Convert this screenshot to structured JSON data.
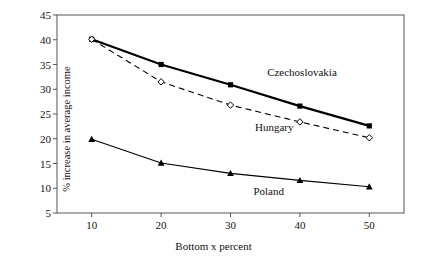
{
  "chart_data": {
    "type": "line",
    "title": "",
    "subtitle": "",
    "xlabel": "Bottom x percent",
    "ylabel": "% increase in average income",
    "x": [
      10,
      20,
      30,
      40,
      50
    ],
    "xtick_labels": [
      "10",
      "20",
      "30",
      "40",
      "50"
    ],
    "ytick_labels": [
      "5",
      "10",
      "15",
      "20",
      "25",
      "30",
      "35",
      "40",
      "45"
    ],
    "yticks": [
      5,
      10,
      15,
      20,
      25,
      30,
      35,
      40,
      45
    ],
    "xlim": [
      5,
      55
    ],
    "ylim": [
      5,
      45
    ],
    "grid": false,
    "legend_position": "inline-annotations",
    "series": [
      {
        "name": "Czechoslovakia",
        "values": [
          40.1,
          35.0,
          30.9,
          26.6,
          22.6
        ],
        "marker": "filled-square",
        "line_style": "solid",
        "line_width": 2.2,
        "color": "#000000",
        "label_x": 40.3,
        "label_y": 33.4
      },
      {
        "name": "Hungary",
        "values": [
          40.1,
          31.5,
          26.8,
          23.4,
          20.2
        ],
        "marker": "open-diamond",
        "line_style": "dashed",
        "line_width": 1.1,
        "color": "#000000",
        "label_x": 36.3,
        "label_y": 22.3
      },
      {
        "name": "Poland",
        "values": [
          19.9,
          15.1,
          13.0,
          11.6,
          10.3
        ],
        "marker": "filled-triangle",
        "line_style": "solid",
        "line_width": 1.1,
        "color": "#000000",
        "label_x": 35.5,
        "label_y": 9.4
      }
    ],
    "annotations": [
      "Czechoslovakia",
      "Hungary",
      "Poland"
    ],
    "axis_color": "#555555",
    "background_color": "#ffffff"
  }
}
